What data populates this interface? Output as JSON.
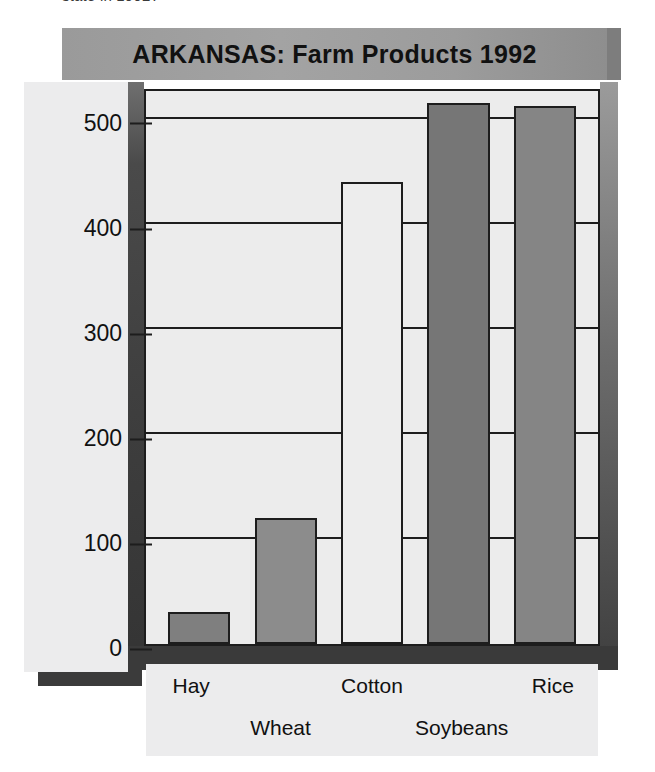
{
  "page": {
    "top_caption": "state in 1992?"
  },
  "figure": {
    "title": "ARKANSAS: Farm Products 1992"
  },
  "chart_data": {
    "type": "bar",
    "title": "ARKANSAS: Farm Products 1992",
    "xlabel": "",
    "ylabel": "Millons of dollars produced",
    "categories": [
      "Hay",
      "Wheat",
      "Cotton",
      "Soybeans",
      "Rice"
    ],
    "values": [
      30,
      120,
      440,
      515,
      512
    ],
    "ylim": [
      0,
      530
    ],
    "yticks": [
      0,
      100,
      200,
      300,
      400,
      500
    ],
    "ytick_labels": [
      "0",
      "100",
      "200",
      "300",
      "400",
      "500"
    ],
    "grid": true,
    "legend": false,
    "bar_colors": [
      "#7f7f7f",
      "#8c8c8c",
      "#ededed",
      "#767676",
      "#858585"
    ]
  },
  "labels": {
    "row_top": [
      "Hay",
      "",
      "Cotton",
      "",
      "Rice"
    ],
    "row_bottom": [
      "",
      "Wheat",
      "",
      "Soybeans",
      ""
    ]
  }
}
